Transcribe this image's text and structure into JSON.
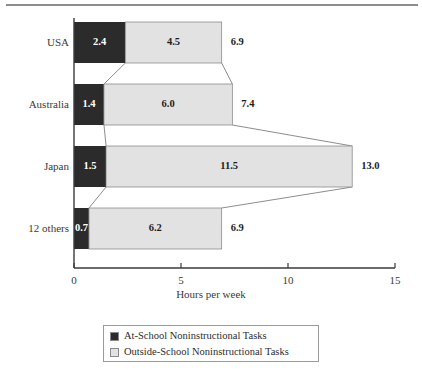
{
  "chart_data": {
    "type": "bar",
    "orientation": "horizontal",
    "stacked": true,
    "title": "",
    "xlabel": "Hours per week",
    "ylabel": "",
    "xlim": [
      0,
      15
    ],
    "ylim": null,
    "grid": false,
    "legend_position": "bottom",
    "xticks": [
      "0",
      "5",
      "10",
      "15"
    ],
    "xtick_values": [
      0,
      5,
      10,
      15
    ],
    "categories": [
      "USA",
      "Australia",
      "Japan",
      "12 others"
    ],
    "series": [
      {
        "name": "At-School Noninstructional Tasks",
        "color": "#2b2b2b",
        "values": [
          2.4,
          1.4,
          1.5,
          0.7
        ],
        "labels": [
          "2.4",
          "1.4",
          "1.5",
          "0.7"
        ]
      },
      {
        "name": "Outside-School Noninstructional Tasks",
        "color": "#e2e2e2",
        "values": [
          4.5,
          6.0,
          11.5,
          6.2
        ],
        "labels": [
          "4.5",
          "6.0",
          "11.5",
          "6.2"
        ]
      }
    ],
    "totals": [
      6.9,
      7.4,
      13.0,
      6.9
    ],
    "total_labels": [
      "6.9",
      "7.4",
      "13.0",
      "6.9"
    ]
  },
  "legend": {
    "items": [
      {
        "label": "At-School Noninstructional Tasks",
        "color": "#2b2b2b"
      },
      {
        "label": "Outside-School Noninstructional Tasks",
        "color": "#e2e2e2"
      }
    ]
  },
  "axis": {
    "x_title": "Hours per week"
  }
}
